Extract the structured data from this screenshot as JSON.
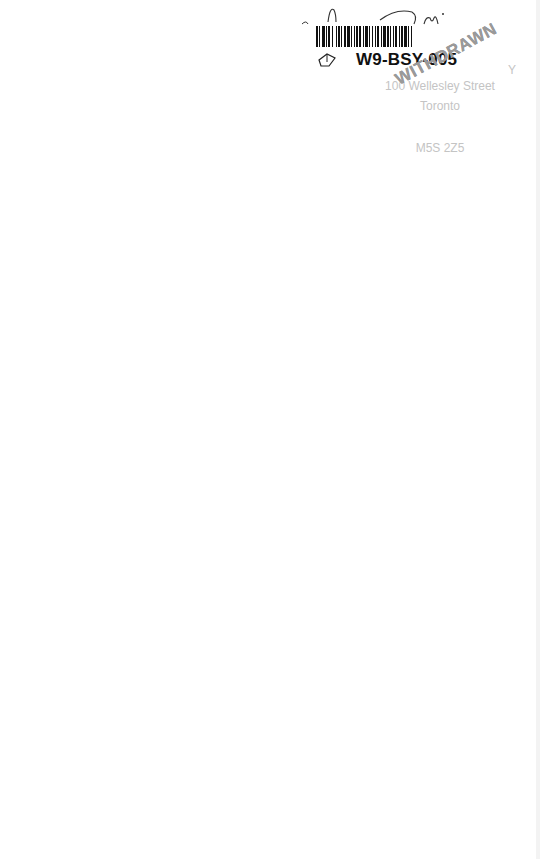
{
  "page": {
    "background": "#ffffff"
  },
  "label": {
    "handwriting": "Dm",
    "barcode_id": "W9-BSY-005",
    "barcode_color": "#111111"
  },
  "address": {
    "line0": "Y",
    "line1": "100 Wellesley Street",
    "line2": "Toronto",
    "line3": "",
    "line4": "M5S 2Z5",
    "color": "#c4c4c4"
  },
  "stamp": {
    "text": "WITHDRAWN",
    "color": "#9a9a9a"
  },
  "icons": {
    "book": "book-icon"
  }
}
